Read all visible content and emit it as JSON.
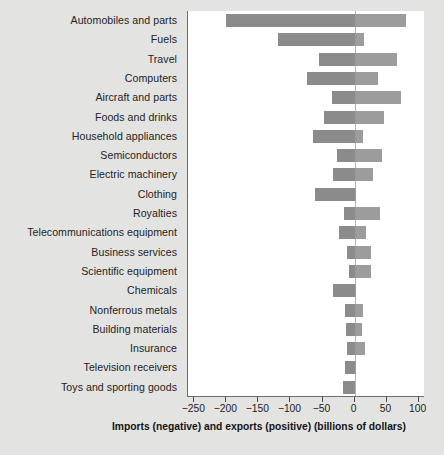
{
  "chart_data": {
    "type": "bar",
    "orientation": "horizontal",
    "title": "",
    "xlabel": "Imports (negative) and exports (positive) (billions of dollars)",
    "ylabel": "",
    "xlim": [
      -260,
      110
    ],
    "xticks": [
      -250,
      -200,
      -150,
      -100,
      -50,
      0,
      50,
      100
    ],
    "xtick_labels": [
      "−250",
      "−200",
      "−150",
      "−100",
      "−50",
      "0",
      "50",
      "100"
    ],
    "grid": false,
    "legend": null,
    "categories": [
      "Automobiles and parts",
      "Fuels",
      "Travel",
      "Computers",
      "Aircraft and parts",
      "Foods and drinks",
      "Household appliances",
      "Semiconductors",
      "Electric machinery",
      "Clothing",
      "Royalties",
      "Telecommunications equipment",
      "Business services",
      "Scientific equipment",
      "Chemicals",
      "Nonferrous metals",
      "Building materials",
      "Insurance",
      "Television receivers",
      "Toys and sporting goods"
    ],
    "series": [
      {
        "name": "Imports (negative)",
        "color": "#8b8b8b",
        "values": [
          -200,
          -120,
          -55,
          -75,
          -35,
          -47,
          -65,
          -28,
          -33,
          -61,
          -17,
          -25,
          -12,
          -9,
          -33,
          -15,
          -14,
          -11,
          -15,
          -18
        ]
      },
      {
        "name": "Exports (positive)",
        "color": "#9c9c9c",
        "values": [
          80,
          15,
          67,
          36,
          73,
          46,
          14,
          43,
          29,
          1,
          39,
          18,
          25,
          26,
          2,
          13,
          11,
          17,
          3,
          0
        ]
      }
    ]
  },
  "axis": {
    "title": "Imports (negative) and exports (positive) (billions of dollars)"
  },
  "colors": {
    "background": "#e3e3e2",
    "plot_background": "#ffffff",
    "import_bar": "#8b8b8b",
    "export_bar": "#9c9c9c",
    "axis_line": "#6e6e6e",
    "zero_line": "#b4b4b4"
  }
}
